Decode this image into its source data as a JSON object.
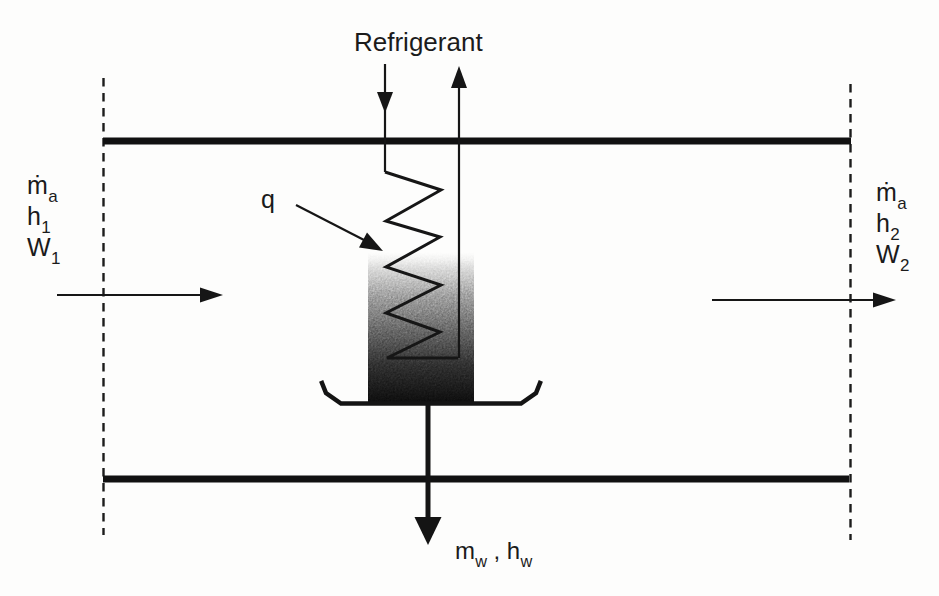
{
  "colors": {
    "ink": "#161616",
    "background": "#fdfdfc",
    "shading_top": "#bdbdbd",
    "shading_bottom": "#141414"
  },
  "labels": {
    "refrigerant": "Refrigerant",
    "heat": "q",
    "air_in": {
      "mass": {
        "base": "ṁ",
        "sub": "a"
      },
      "enthalpy": {
        "base": "h",
        "sub": "1"
      },
      "humidity": {
        "base": "W",
        "sub": "1"
      }
    },
    "air_out": {
      "mass": {
        "base": "ṁ",
        "sub": "a"
      },
      "enthalpy": {
        "base": "h",
        "sub": "2"
      },
      "humidity": {
        "base": "W",
        "sub": "2"
      }
    },
    "condensate": {
      "mass": {
        "base": "m",
        "sub": "w"
      },
      "separator": " , ",
      "enthalpy": {
        "base": "h",
        "sub": "w"
      }
    }
  }
}
